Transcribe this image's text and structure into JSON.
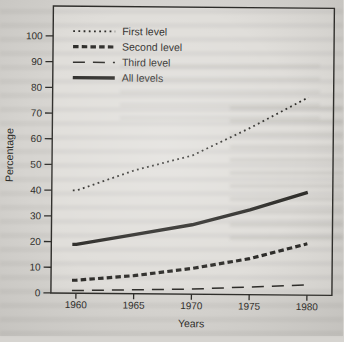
{
  "scan": {
    "page_bg": "#d6d4d0",
    "ink": "#2e2d2a"
  },
  "chart_data": {
    "type": "line",
    "title": "",
    "xlabel": "Years",
    "ylabel": "Percentage",
    "x": [
      1960,
      1965,
      1970,
      1975,
      1980
    ],
    "xtick_labels": [
      "1960",
      "1965",
      "1970",
      "1975",
      "1980"
    ],
    "ylim": [
      0,
      100
    ],
    "ytick_step": 10,
    "grid": false,
    "frame": true,
    "legend_position": "top-left",
    "series": [
      {
        "name": "First level",
        "style": "dotted",
        "values": [
          40,
          48,
          54,
          65,
          77
        ]
      },
      {
        "name": "Second level",
        "style": "dash-thick",
        "values": [
          5,
          7,
          10,
          14,
          20
        ]
      },
      {
        "name": "Third level",
        "style": "dash-long",
        "values": [
          1,
          1.5,
          2,
          3,
          4
        ]
      },
      {
        "name": "All levels",
        "style": "solid",
        "values": [
          19,
          23,
          27,
          33,
          40
        ]
      }
    ]
  }
}
